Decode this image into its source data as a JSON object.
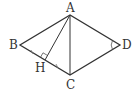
{
  "diagram": {
    "points": {
      "A": {
        "label": "A",
        "x": 70,
        "y": 15
      },
      "B": {
        "label": "B",
        "x": 20,
        "y": 45
      },
      "C": {
        "label": "C",
        "x": 70,
        "y": 75
      },
      "D": {
        "label": "D",
        "x": 120,
        "y": 45
      },
      "H": {
        "label": "H",
        "x": 45,
        "y": 60
      }
    },
    "segments": [
      "AB",
      "BC",
      "CD",
      "DA",
      "AC",
      "AH"
    ],
    "marks": {
      "right_angle_at": "H",
      "angle_arc_at": "D",
      "equal_ticks_on": [
        "BH",
        "HC"
      ]
    },
    "colors": {
      "line": "#333333",
      "background": "#ffffff"
    }
  }
}
